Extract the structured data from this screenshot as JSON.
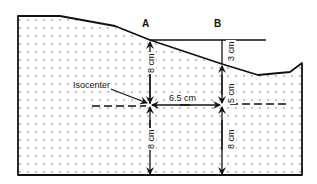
{
  "diagram": {
    "type": "dosimetry-depth-diagram",
    "points": [
      {
        "id": "A",
        "label": "A"
      },
      {
        "id": "B",
        "label": "B"
      }
    ],
    "isocenter_label": "Isocenter",
    "dimensions": {
      "A_depth_above": "8 cm",
      "A_depth_below": "8 cm",
      "B_gap_top": "3 cm",
      "B_depth_above": "5 cm",
      "B_depth_below": "8 cm",
      "AB_separation": "6.5 cm"
    },
    "colors": {
      "line": "#111111",
      "background": "#ffffff",
      "dots": "#555555"
    }
  }
}
